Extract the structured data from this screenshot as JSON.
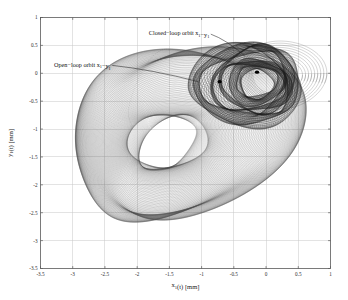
{
  "chart_data": {
    "type": "line",
    "title": "",
    "xlabel": "x₁(t) [mm]",
    "ylabel": "y₁(t) [mm]",
    "xlim": [
      -3.5,
      1
    ],
    "ylim": [
      -3.5,
      1
    ],
    "xticks": [
      -3.5,
      -3,
      -2.5,
      -2,
      -1.5,
      -1,
      -0.5,
      0,
      0.5,
      1
    ],
    "yticks": [
      -3.5,
      -3,
      -2.5,
      -2,
      -1.5,
      -1,
      -0.5,
      0,
      0.5,
      1
    ],
    "xticklabels": [
      "-3.5",
      "-3",
      "-2.5",
      "-2",
      "-1.5",
      "-1",
      "-0.5",
      "0",
      "0.5",
      "1"
    ],
    "yticklabels": [
      "-3.5",
      "-3",
      "-2.5",
      "-2",
      "-1.5",
      "-1",
      "-0.5",
      "0",
      "0.5",
      "1"
    ],
    "grid": true,
    "legend_position": "none",
    "annotations": [
      {
        "id": "closed-loop-annotation",
        "text": "Closed−loop orbit x₁−y₁",
        "text_x": -1.35,
        "text_y": 0.68,
        "point_x": -0.33,
        "point_y": 0.31
      },
      {
        "id": "open-loop-annotation",
        "text": "Open−loop orbit x₁−y₁",
        "text_x": -2.85,
        "text_y": 0.12,
        "point_x": -1.05,
        "point_y": -0.15
      }
    ],
    "series": [
      {
        "name": "Open−loop orbit x₁−y₁",
        "description": "Large quasi-periodic egg-shaped orbit cloud spanning roughly x in [-3.25, 0.55] and y in [-3.05, 0.45], densest near the center-left lobe.",
        "color": "#4a4a4a",
        "center_x": -1.55,
        "center_y": -1.25,
        "radius_x": 1.72,
        "radius_y": 1.62
      },
      {
        "name": "Closed−loop orbit x₁−y₁",
        "description": "Compact dark attractor cluster concentrated around x in [-1.05, 0.6] and y in [-0.85, 0.45].",
        "color": "#1c1c1c",
        "center_x": -0.2,
        "center_y": -0.18,
        "radius_x": 0.62,
        "radius_y": 0.56
      },
      {
        "name": "Transient outer loops",
        "description": "Thin open transient loops extending to the upper right toward x = 0.62, y = 0.5.",
        "color": "#3a3a3a",
        "center_x": 0.15,
        "center_y": -0.05,
        "radius_x": 0.55,
        "radius_y": 0.52
      }
    ],
    "markers": [
      {
        "name": "open-loop-marker",
        "x": -0.72,
        "y": -0.15
      },
      {
        "name": "closed-loop-marker",
        "x": -0.14,
        "y": 0.02
      }
    ]
  }
}
